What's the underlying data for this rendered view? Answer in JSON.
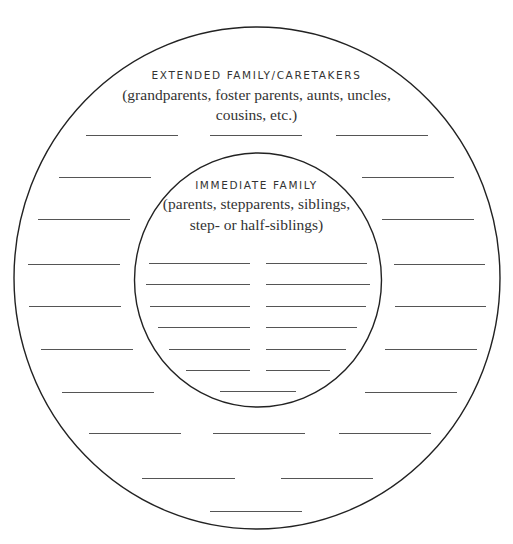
{
  "diagram": {
    "type": "concentric-circles-worksheet",
    "stroke_color": "#222222",
    "line_color": "#555555",
    "text_color": "#333333",
    "outer_ring": {
      "heading": "EXTENDED FAMILY/CARETAKERS",
      "description_lines": [
        "(grandparents, foster parents, aunts, uncles,",
        "cousins, etc.)"
      ],
      "blank_count": 27
    },
    "inner_circle": {
      "heading": "IMMEDIATE FAMILY",
      "description_lines": [
        "(parents, stepparents, siblings,",
        "step- or half-siblings)"
      ],
      "blank_count": 13
    }
  }
}
